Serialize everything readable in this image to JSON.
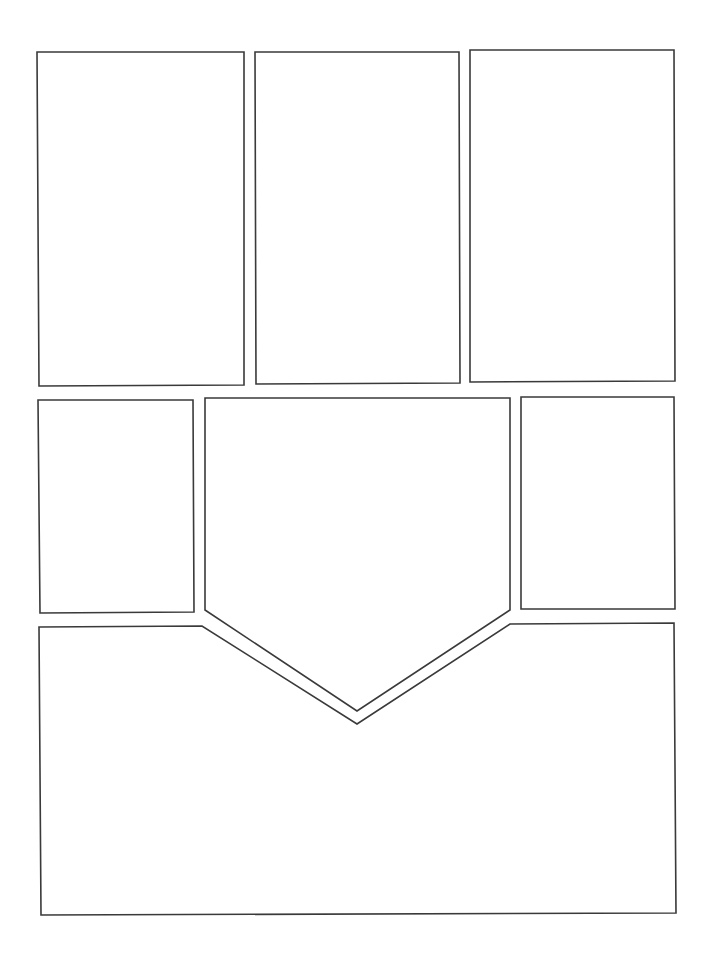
{
  "page": {
    "type": "comic-page-layout-template",
    "width": 710,
    "height": 955,
    "background": "#ffffff",
    "stroke_color": "#3a3a3a",
    "panel_count": 7
  },
  "panels": [
    {
      "id": 1,
      "shape": "rectangle",
      "points": "37,52 244,52 244,385 39,386"
    },
    {
      "id": 2,
      "shape": "rectangle",
      "points": "255,52 459,52 460,383 256,384"
    },
    {
      "id": 3,
      "shape": "rectangle",
      "points": "470,50 674,50 675,381 470,382"
    },
    {
      "id": 4,
      "shape": "rectangle",
      "points": "38,400 193,400 194,612 40,613"
    },
    {
      "id": 5,
      "shape": "pentagon",
      "points": "205,398 510,398 510,610 357,711 205,610"
    },
    {
      "id": 6,
      "shape": "rectangle",
      "points": "521,397 674,397 675,609 521,609"
    },
    {
      "id": 7,
      "shape": "notched-rectangle",
      "points": "39,627 202,626 357,724 510,624 674,623 676,913 41,915"
    }
  ]
}
